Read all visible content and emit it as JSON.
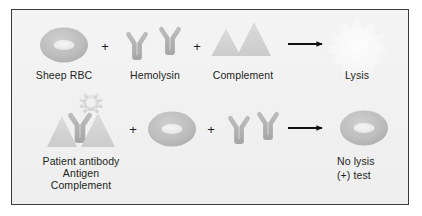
{
  "figure": {
    "panel_background": "#f1f1f1",
    "panel_border_color": "#3b3b3b",
    "page_background": "#ffffff"
  },
  "palette": {
    "cell_fill": "#b9b9b9",
    "cell_center": "#efefef",
    "antibody_fill": "#b0b0b0",
    "triangle_fill": "#d2d2d2",
    "antigen_fill": "#dcdcdc",
    "starburst_fill": "#f7f7f7",
    "arrow_color": "#111111",
    "text_color": "#231f20"
  },
  "rows": [
    {
      "id": "control-row",
      "name": "negative-control-reaction",
      "items": [
        {
          "id": "sheep-rbc",
          "kind": "red-blood-cell",
          "label": "Sheep RBC"
        },
        {
          "id": "hemolysin",
          "kind": "antibody-pair",
          "label": "Hemolysin"
        },
        {
          "id": "complement",
          "kind": "triangle-pair",
          "label": "Complement"
        },
        {
          "id": "lysis",
          "kind": "starburst",
          "label": "Lysis"
        }
      ],
      "operators": [
        "+",
        "+"
      ],
      "arrow": "→"
    },
    {
      "id": "test-row",
      "name": "positive-test-reaction",
      "items": [
        {
          "id": "patient-complex",
          "kind": "antigen-antibody-complement-complex",
          "label_lines": [
            "Patient antibody",
            "Antigen",
            "Complement"
          ]
        },
        {
          "id": "sheep-rbc-2",
          "kind": "red-blood-cell",
          "label": ""
        },
        {
          "id": "hemolysin-2",
          "kind": "antibody-pair",
          "label": ""
        },
        {
          "id": "no-lysis",
          "kind": "red-blood-cell-intact",
          "label_lines": [
            "No lysis",
            "(+) test"
          ]
        }
      ],
      "operators": [
        "+",
        "+"
      ],
      "arrow": "→"
    }
  ],
  "labels": {
    "sheep_rbc": "Sheep RBC",
    "hemolysin": "Hemolysin",
    "complement": "Complement",
    "lysis": "Lysis",
    "patient_antibody": "Patient antibody",
    "antigen": "Antigen",
    "complement_2": "Complement",
    "no_lysis": "No lysis",
    "positive_test": "(+) test",
    "plus_1": "+",
    "plus_2": "+",
    "plus_3": "+",
    "plus_4": "+"
  }
}
